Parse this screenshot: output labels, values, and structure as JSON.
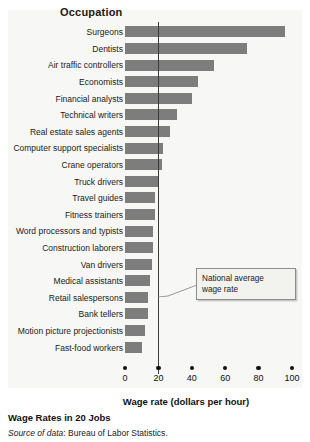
{
  "chart_data": {
    "type": "bar",
    "orientation": "horizontal",
    "title": "Occupation",
    "xlabel": "Wage rate (dollars per hour)",
    "ylabel": "Occupation",
    "xlim": [
      0,
      100
    ],
    "xticks": [
      "0",
      "20",
      "40",
      "60",
      "80",
      "100"
    ],
    "xtick_values": [
      0,
      20,
      40,
      60,
      80,
      100
    ],
    "grid": false,
    "legend": "none",
    "bar_color": "#7d7d7d",
    "reference_line": {
      "label": "National average wage rate",
      "value": 20,
      "color": "#3a3a3a"
    },
    "categories": [
      "Surgeons",
      "Dentists",
      "Air traffic controllers",
      "Economists",
      "Financial analysts",
      "Technical writers",
      "Real estate sales agents",
      "Computer support specialists",
      "Crane operators",
      "Truck drivers",
      "Travel guides",
      "Fitness trainers",
      "Word processors and typists",
      "Construction laborers",
      "Van drivers",
      "Medical assistants",
      "Retail salespersons",
      "Bank tellers",
      "Motion picture projectionists",
      "Fast-food workers"
    ],
    "values": [
      96,
      73,
      53,
      44,
      40,
      31,
      27,
      23,
      22,
      20,
      18,
      18,
      17,
      17,
      16,
      15,
      14,
      14,
      12,
      10
    ]
  },
  "annotation": {
    "line1": "National average",
    "line2": "wage rate"
  },
  "caption": {
    "title": "Wage Rates in 20 Jobs",
    "source_label": "Source of data",
    "source_text": ": Bureau of Labor Statistics."
  }
}
